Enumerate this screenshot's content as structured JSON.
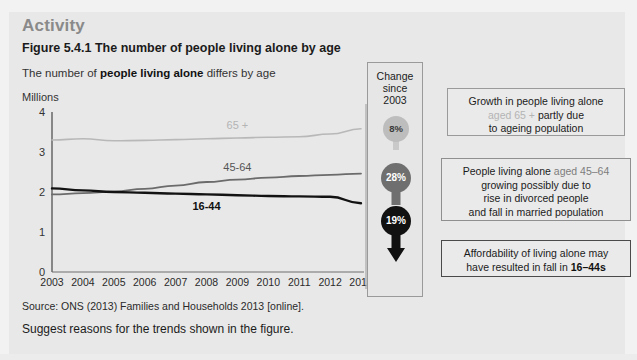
{
  "page": {
    "activity_title": "Activity",
    "figure_title": "Figure 5.4.1 The number of people living alone by age",
    "subtitle_pre": "The number of ",
    "subtitle_bold": "people living alone",
    "subtitle_post": " differs by age",
    "source": "Source: ONS (2013) Families and Households 2013 [online].",
    "suggestion": "Suggest reasons for the trends shown in the figure."
  },
  "chart_data": {
    "type": "line",
    "title": "Figure 5.4.1 The number of people living alone by age",
    "subtitle": "The number of people living alone differs by age",
    "xlabel": "",
    "ylabel": "Millions",
    "ylim": [
      0,
      4
    ],
    "yticks": [
      "0",
      "1",
      "2",
      "3",
      "4"
    ],
    "grid": false,
    "legend": "inline-labels",
    "categories": [
      "2003",
      "2004",
      "2005",
      "2006",
      "2007",
      "2008",
      "2009",
      "2010",
      "2011",
      "2012",
      "2013"
    ],
    "series": [
      {
        "name": "65 +",
        "label": "65 +",
        "color": "#b8b8b8",
        "values": [
          3.3,
          3.33,
          3.28,
          3.29,
          3.31,
          3.33,
          3.35,
          3.37,
          3.38,
          3.45,
          3.58
        ]
      },
      {
        "name": "45-64",
        "label": "45-64",
        "color": "#6b6b6b",
        "values": [
          1.94,
          1.97,
          2.01,
          2.08,
          2.16,
          2.25,
          2.31,
          2.36,
          2.4,
          2.43,
          2.46
        ]
      },
      {
        "name": "16-44",
        "label": "16-44",
        "color": "#121212",
        "values": [
          2.09,
          2.04,
          2.0,
          1.98,
          1.96,
          1.94,
          1.92,
          1.9,
          1.89,
          1.88,
          1.72
        ]
      }
    ]
  },
  "change_panel": {
    "heading_lines": [
      "Change",
      "since",
      "2003"
    ],
    "markers": [
      {
        "id": "65",
        "value": "8%",
        "direction": "up",
        "series": "65 +",
        "color": "#bdbdbd"
      },
      {
        "id": "45",
        "value": "28%",
        "direction": "up",
        "series": "45-64",
        "color": "#6f6f6f"
      },
      {
        "id": "16",
        "value": "19%",
        "direction": "down",
        "series": "16-44",
        "color": "#111111"
      }
    ]
  },
  "callouts": [
    {
      "id": "callout-1",
      "line1_pre": "Growth in people living alone",
      "line2_tag": "aged 65 +",
      "line2_post": " partly due",
      "line3": "to ageing population"
    },
    {
      "id": "callout-2",
      "line1_pre": "People living alone ",
      "line1_tag": "aged 45–64",
      "line2": "growing possibly due to",
      "line3": "rise in divorced people",
      "line4": "and fall in married population"
    },
    {
      "id": "callout-3",
      "line1": "Affordability of living alone may",
      "line2_pre": "have resulted in fall in ",
      "line2_tag": "16–44s"
    }
  ]
}
